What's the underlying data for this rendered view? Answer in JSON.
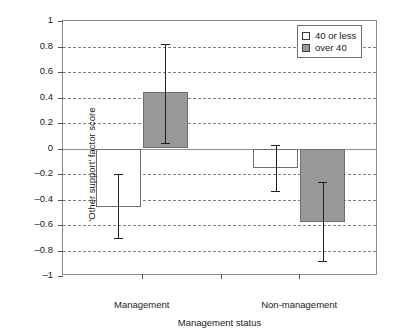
{
  "chart_data": {
    "type": "bar",
    "title": "",
    "xlabel": "Management status",
    "ylabel": "'Other support' factor score",
    "categories": [
      "Management",
      "Non-management"
    ],
    "ylim": [
      -1,
      1
    ],
    "yticks": [
      1,
      0.8,
      0.6,
      0.4,
      0.2,
      0,
      -0.2,
      -0.4,
      -0.6,
      -0.8,
      -1
    ],
    "ytick_labels": [
      "1",
      "0.8",
      "0.6",
      "0.4",
      "0.2",
      "0",
      "–0.2",
      "–0.4",
      "–0.6",
      "–0.8",
      "–1"
    ],
    "grid": true,
    "legend_position": "top-right",
    "error_bars": true,
    "series": [
      {
        "name": "40 or less",
        "fill": "#ffffff",
        "values": [
          -0.455,
          -0.155
        ],
        "err_low": [
          -0.7,
          -0.33
        ],
        "err_high": [
          -0.2,
          0.03
        ]
      },
      {
        "name": "over 40",
        "fill": "#999999",
        "values": [
          0.445,
          -0.575
        ],
        "err_low": [
          0.045,
          -0.88
        ],
        "err_high": [
          0.82,
          -0.26
        ]
      }
    ]
  },
  "legend": {
    "items": [
      {
        "label": "40 or less",
        "swatch": "light"
      },
      {
        "label": "over 40",
        "swatch": "dark"
      }
    ]
  },
  "colors": {
    "bar_light": "#ffffff",
    "bar_dark": "#999999",
    "outline": "#6e6e6e",
    "grid": "#808080",
    "axis": "#8c8c8c",
    "error": "#1f1f1f"
  }
}
